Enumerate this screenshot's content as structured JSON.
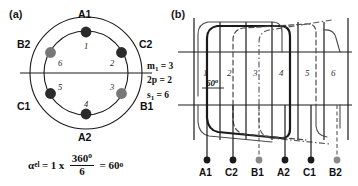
{
  "figure": {
    "panel_a_label": "(a)",
    "panel_b_label": "(b)"
  },
  "panel_a": {
    "ring_labels": [
      {
        "text": "A1",
        "position": "top"
      },
      {
        "text": "C2",
        "position": "upper-right"
      },
      {
        "text": "B1",
        "position": "lower-right"
      },
      {
        "text": "A2",
        "position": "bottom"
      },
      {
        "text": "C1",
        "position": "lower-left"
      },
      {
        "text": "B2",
        "position": "upper-left"
      }
    ],
    "slot_numbers": [
      "1",
      "2",
      "3",
      "4",
      "5",
      "6"
    ],
    "conductor_colors": {
      "dark": "#2b2b2b",
      "gray": "#777777"
    },
    "conductors": [
      {
        "slot": "1",
        "shade": "dark"
      },
      {
        "slot": "2",
        "shade": "dark"
      },
      {
        "slot": "3",
        "shade": "gray"
      },
      {
        "slot": "4",
        "shade": "dark"
      },
      {
        "slot": "5",
        "shade": "dark"
      },
      {
        "slot": "6",
        "shade": "gray"
      }
    ],
    "formula": {
      "symbol": "α",
      "symbol_sub": "el",
      "equals": "=",
      "coefficient": "1",
      "times": "x",
      "numerator": "360",
      "numerator_sup": "o",
      "denominator": "6",
      "equals2": "=",
      "result": "60",
      "result_sup": "o"
    }
  },
  "panel_b": {
    "parameters": [
      {
        "symbol": "m",
        "sub": "1",
        "value": "= 3"
      },
      {
        "symbol": "2p",
        "sub": "",
        "value": "= 2"
      },
      {
        "symbol": "s",
        "sub": "1",
        "value": "= 6"
      }
    ],
    "slot_numbers": [
      "1",
      "2",
      "3",
      "4",
      "5",
      "6"
    ],
    "angle_label": "60",
    "angle_sup": "o",
    "terminals": [
      "A1",
      "C2",
      "B1",
      "A2",
      "C1",
      "B2"
    ],
    "terminal_shades": [
      "dark",
      "dark",
      "gray",
      "dark",
      "dark",
      "gray"
    ]
  }
}
